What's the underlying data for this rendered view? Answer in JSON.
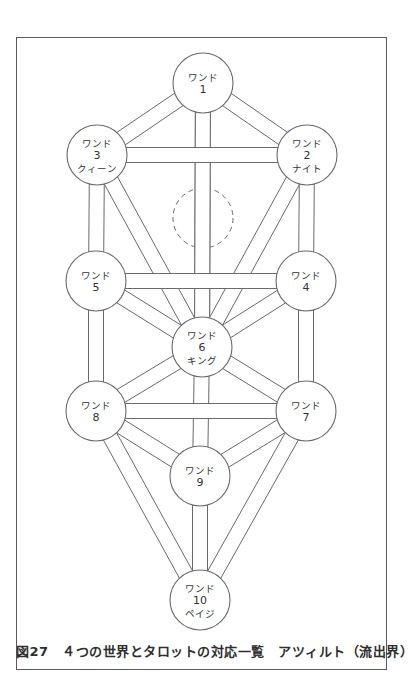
{
  "figure": {
    "caption": "図27　４つの世界とタロットの対応一覧　アツィルト（流出界）",
    "stroke_color": "#6a6a6a",
    "fill_color": "#ffffff"
  },
  "diagram": {
    "type": "tree-of-life",
    "node_radius": 30,
    "path_width": 15,
    "nodes": [
      {
        "id": 1,
        "x": 203,
        "y": 83,
        "lines": [
          "ワンド",
          "1"
        ]
      },
      {
        "id": 2,
        "x": 307,
        "y": 155,
        "lines": [
          "ワンド",
          "2",
          "ナイト"
        ]
      },
      {
        "id": 3,
        "x": 97,
        "y": 155,
        "lines": [
          "ワンド",
          "3",
          "クィーン"
        ]
      },
      {
        "id": 4,
        "x": 306,
        "y": 281,
        "lines": [
          "ワンド",
          "4"
        ]
      },
      {
        "id": 5,
        "x": 96,
        "y": 281,
        "lines": [
          "ワンド",
          "5"
        ]
      },
      {
        "id": 6,
        "x": 202,
        "y": 347,
        "lines": [
          "ワンド",
          "6",
          "キング"
        ]
      },
      {
        "id": 7,
        "x": 306,
        "y": 411,
        "lines": [
          "ワンド",
          "7"
        ]
      },
      {
        "id": 8,
        "x": 96,
        "y": 411,
        "lines": [
          "ワンド",
          "8"
        ]
      },
      {
        "id": 9,
        "x": 200,
        "y": 476,
        "lines": [
          "ワンド",
          "9"
        ]
      },
      {
        "id": 10,
        "x": 200,
        "y": 600,
        "lines": [
          "ワンド",
          "10",
          "ペイジ"
        ]
      }
    ],
    "hidden_node": {
      "name": "daath",
      "x": 203,
      "y": 218,
      "r": 30,
      "dashed": true
    },
    "paths_back": [
      [
        1,
        6
      ],
      [
        3,
        6
      ],
      [
        2,
        6
      ],
      [
        3,
        5
      ],
      [
        2,
        4
      ],
      [
        5,
        8
      ],
      [
        4,
        7
      ],
      [
        6,
        9
      ],
      [
        9,
        10
      ],
      [
        8,
        10
      ],
      [
        7,
        10
      ],
      [
        5,
        6
      ],
      [
        4,
        6
      ],
      [
        6,
        8
      ],
      [
        6,
        7
      ],
      [
        8,
        9
      ],
      [
        7,
        9
      ],
      [
        1,
        2
      ],
      [
        1,
        3
      ]
    ],
    "paths_front": [
      [
        3,
        2
      ],
      [
        5,
        4
      ],
      [
        8,
        7
      ]
    ]
  }
}
